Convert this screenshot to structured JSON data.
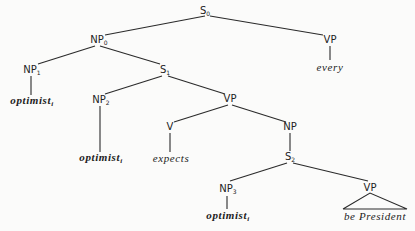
{
  "tree": {
    "nodes": {
      "s0": {
        "label": "S",
        "sub": "0"
      },
      "np0": {
        "label": "NP",
        "sub": "0"
      },
      "vp_top": {
        "label": "VP",
        "sub": ""
      },
      "every": {
        "label": "every",
        "sub": ""
      },
      "np1": {
        "label": "NP",
        "sub": "1"
      },
      "optimist1": {
        "label": "optimist",
        "sub": "i"
      },
      "s1": {
        "label": "S",
        "sub": "1"
      },
      "np2": {
        "label": "NP",
        "sub": "2"
      },
      "optimist2": {
        "label": "optimist",
        "sub": "i"
      },
      "vp_mid": {
        "label": "VP",
        "sub": ""
      },
      "v": {
        "label": "V",
        "sub": ""
      },
      "expects": {
        "label": "expects",
        "sub": ""
      },
      "np_mid": {
        "label": "NP",
        "sub": ""
      },
      "s2": {
        "label": "S",
        "sub": "2"
      },
      "np3": {
        "label": "NP",
        "sub": "3"
      },
      "optimist3": {
        "label": "optimist",
        "sub": "i"
      },
      "vp_bottom": {
        "label": "VP",
        "sub": ""
      },
      "be_president": {
        "label": "be President",
        "sub": ""
      }
    }
  }
}
